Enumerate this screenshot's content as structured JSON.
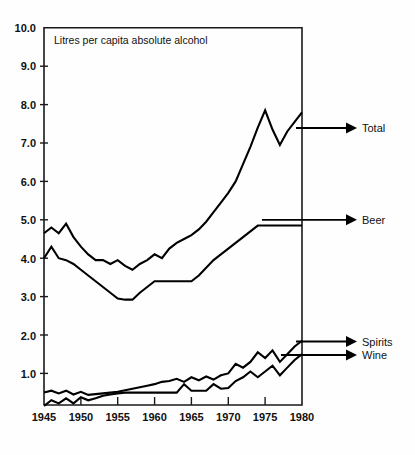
{
  "chart_data": {
    "type": "line",
    "title": "Litres per capita absolute alcohol",
    "xlabel": "",
    "ylabel": "",
    "xlim": [
      1945,
      1980
    ],
    "ylim": [
      0,
      10
    ],
    "grid": false,
    "legend_position": "right-inline-arrows",
    "x_ticks": [
      1945,
      1950,
      1955,
      1960,
      1965,
      1970,
      1975,
      1980
    ],
    "y_ticks": [
      0,
      1.0,
      2.0,
      3.0,
      4.0,
      5.0,
      6.0,
      7.0,
      8.0,
      9.0,
      10.0
    ],
    "y_tick_labels": [
      "1.0",
      "2.0",
      "3.0",
      "4.0",
      "5.0",
      "6.0",
      "7.0",
      "8.0",
      "9.0",
      "10.0"
    ],
    "x": [
      1945,
      1946,
      1947,
      1948,
      1949,
      1950,
      1951,
      1952,
      1953,
      1954,
      1955,
      1956,
      1957,
      1958,
      1959,
      1960,
      1961,
      1962,
      1963,
      1964,
      1965,
      1966,
      1967,
      1968,
      1969,
      1970,
      1971,
      1972,
      1973,
      1974,
      1975,
      1976,
      1977,
      1978,
      1979,
      1980
    ],
    "series": [
      {
        "name": "Total",
        "label": "Total",
        "values": [
          4.65,
          4.8,
          4.65,
          4.9,
          4.55,
          4.3,
          4.1,
          3.95,
          3.95,
          3.85,
          3.95,
          3.8,
          3.7,
          3.85,
          3.95,
          4.1,
          4.0,
          4.25,
          4.4,
          4.5,
          4.6,
          4.75,
          4.95,
          5.2,
          5.45,
          5.7,
          6.0,
          6.45,
          6.9,
          7.4,
          7.85,
          7.35,
          6.95,
          7.3,
          7.55,
          7.8
        ]
      },
      {
        "name": "Beer",
        "label": "Beer",
        "values": [
          4.0,
          4.3,
          4.0,
          3.95,
          3.85,
          3.7,
          3.55,
          3.4,
          3.25,
          3.1,
          2.95,
          2.92,
          2.92,
          3.1,
          3.25,
          3.4,
          3.4,
          3.4,
          3.4,
          3.4,
          3.4,
          3.55,
          3.75,
          3.95,
          4.1,
          4.25,
          4.4,
          4.55,
          4.7,
          4.85,
          4.85,
          4.85,
          4.85,
          4.85,
          4.85,
          4.85
        ]
      },
      {
        "name": "Spirits",
        "label": "Spirits",
        "values": [
          0.5,
          0.55,
          0.48,
          0.55,
          0.45,
          0.52,
          0.44,
          0.46,
          0.48,
          0.5,
          0.52,
          0.56,
          0.6,
          0.64,
          0.68,
          0.72,
          0.78,
          0.8,
          0.86,
          0.78,
          0.9,
          0.82,
          0.92,
          0.84,
          0.95,
          1.0,
          1.25,
          1.15,
          1.3,
          1.55,
          1.4,
          1.6,
          1.3,
          1.5,
          1.7,
          1.85
        ]
      },
      {
        "name": "Wine",
        "label": "Wine",
        "values": [
          0.15,
          0.3,
          0.22,
          0.35,
          0.22,
          0.38,
          0.3,
          0.35,
          0.42,
          0.45,
          0.48,
          0.5,
          0.5,
          0.5,
          0.5,
          0.5,
          0.5,
          0.5,
          0.5,
          0.72,
          0.55,
          0.55,
          0.55,
          0.72,
          0.6,
          0.62,
          0.8,
          0.9,
          1.05,
          0.9,
          1.05,
          1.2,
          0.95,
          1.15,
          1.35,
          1.5
        ]
      }
    ]
  },
  "annotations": {
    "total_label": "Total",
    "beer_label": "Beer",
    "spirits_label": "Spirits",
    "wine_label": "Wine"
  },
  "axis": {
    "y_labels": [
      "10.0",
      "9.0",
      "8.0",
      "7.0",
      "6.0",
      "5.0",
      "4.0",
      "3.0",
      "2.0",
      "1.0"
    ],
    "x_labels": [
      "1945",
      "1950",
      "1955",
      "1960",
      "1965",
      "1970",
      "1975",
      "1980"
    ]
  }
}
